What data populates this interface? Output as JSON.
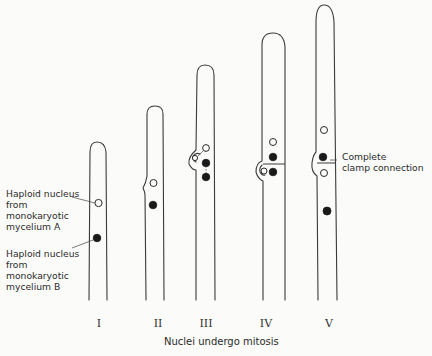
{
  "labels": {
    "nucleus_a": "Haploid nucleus\nfrom\nmonokaryotic\nmycelium  A",
    "nucleus_b": "Haploid nucleus\nfrom\nmonokaryotic\nmycelium  B",
    "clamp": "Complete\nclamp connection"
  },
  "stages": [
    {
      "numeral": "I",
      "description": "Dikaryotic hypha with one nucleus from each mycelium"
    },
    {
      "numeral": "II",
      "description": "Clamp initial forms"
    },
    {
      "numeral": "III",
      "description": "Nuclei divide; one enters clamp"
    },
    {
      "numeral": "IV",
      "description": "Septa form"
    },
    {
      "numeral": "V",
      "description": "Clamp fuses, complete clamp connection"
    }
  ],
  "caption": "Nuclei undergo mitosis",
  "colors": {
    "line": "#3a3a3a",
    "background": "#fbfbf9",
    "filled_nucleus": "#1a1a1a"
  }
}
